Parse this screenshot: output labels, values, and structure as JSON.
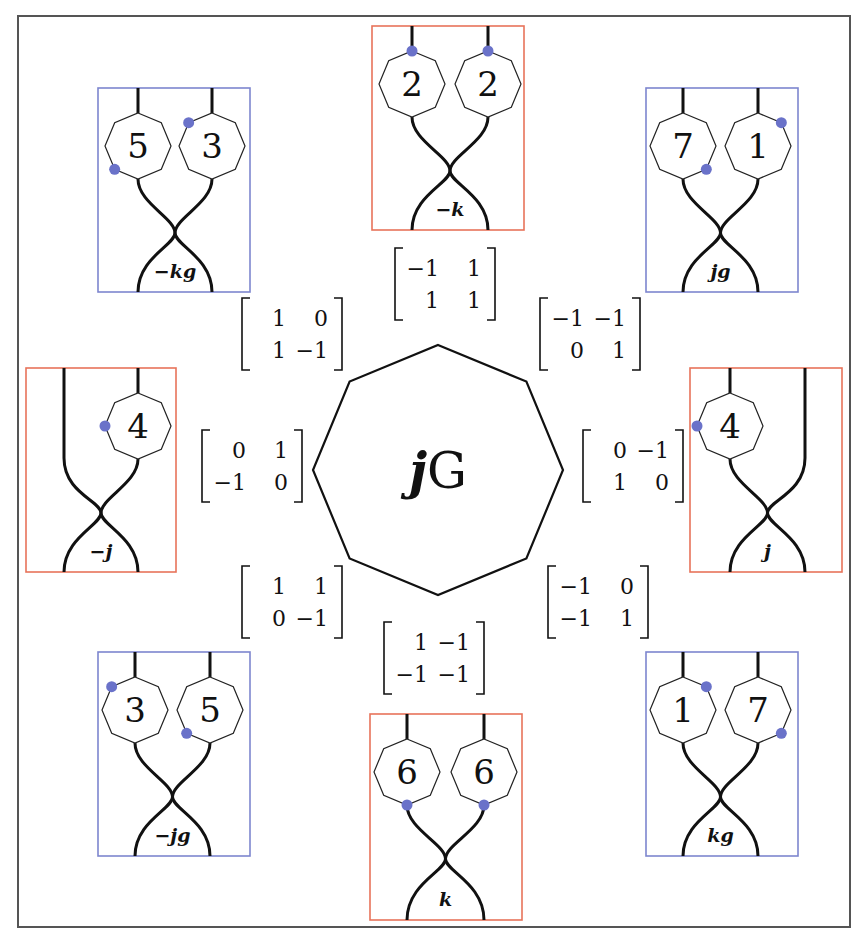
{
  "diagram": {
    "center": {
      "label_j": "j",
      "label_G": "G"
    },
    "colors": {
      "orange_box": "#e8735a",
      "blue_box": "#7d86cf",
      "dot": "#6a72c9",
      "stroke": "#111111",
      "frame": "#555555"
    },
    "panels": [
      {
        "id": "top",
        "label": "−k",
        "box": "orange",
        "strands": 2,
        "nodes": [
          "2",
          "2"
        ],
        "dots": [
          "top",
          "top"
        ]
      },
      {
        "id": "top-left",
        "label": "−kg",
        "box": "blue",
        "strands": 2,
        "nodes": [
          "5",
          "3"
        ],
        "dots": [
          "lower-left",
          "upper-left"
        ]
      },
      {
        "id": "top-right",
        "label": "jg",
        "box": "blue",
        "strands": 2,
        "nodes": [
          "7",
          "1"
        ],
        "dots": [
          "lower-right",
          "upper-right"
        ]
      },
      {
        "id": "left",
        "label": "−j",
        "box": "orange",
        "strands": 2,
        "nodes": [
          null,
          "4"
        ],
        "dots": [
          null,
          "left"
        ]
      },
      {
        "id": "right",
        "label": "j",
        "box": "orange",
        "strands": 2,
        "nodes": [
          "4",
          null
        ],
        "dots": [
          "left",
          null
        ]
      },
      {
        "id": "bottom-left",
        "label": "−jg",
        "box": "blue",
        "strands": 2,
        "nodes": [
          "3",
          "5"
        ],
        "dots": [
          "upper-left",
          "lower-left"
        ]
      },
      {
        "id": "bottom",
        "label": "k",
        "box": "orange",
        "strands": 2,
        "nodes": [
          "6",
          "6"
        ],
        "dots": [
          "bottom",
          "bottom"
        ]
      },
      {
        "id": "bottom-right",
        "label": "kg",
        "box": "blue",
        "strands": 2,
        "nodes": [
          "1",
          "7"
        ],
        "dots": [
          "upper-right",
          "lower-right"
        ]
      }
    ],
    "matrices": [
      {
        "id": "top",
        "rows": [
          [
            "−1",
            "1"
          ],
          [
            "1",
            "1"
          ]
        ]
      },
      {
        "id": "top-left",
        "rows": [
          [
            "1",
            "0"
          ],
          [
            "1",
            "−1"
          ]
        ]
      },
      {
        "id": "top-right",
        "rows": [
          [
            "−1",
            "−1"
          ],
          [
            "0",
            "1"
          ]
        ]
      },
      {
        "id": "left",
        "rows": [
          [
            "0",
            "1"
          ],
          [
            "−1",
            "0"
          ]
        ]
      },
      {
        "id": "right",
        "rows": [
          [
            "0",
            "−1"
          ],
          [
            "1",
            "0"
          ]
        ]
      },
      {
        "id": "bottom-left",
        "rows": [
          [
            "1",
            "1"
          ],
          [
            "0",
            "−1"
          ]
        ]
      },
      {
        "id": "bottom-right",
        "rows": [
          [
            "−1",
            "0"
          ],
          [
            "−1",
            "1"
          ]
        ]
      },
      {
        "id": "bottom",
        "rows": [
          [
            "1",
            "−1"
          ],
          [
            "−1",
            "−1"
          ]
        ]
      }
    ]
  }
}
